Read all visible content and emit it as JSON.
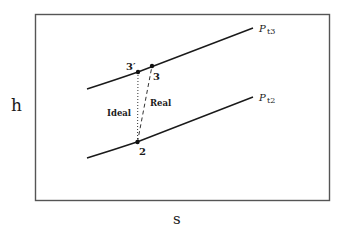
{
  "diagram": {
    "axes": {
      "y_label": "h",
      "x_label": "s"
    },
    "curves": [
      {
        "id": "pt3",
        "label_main": "P",
        "label_sub": "t3"
      },
      {
        "id": "pt2",
        "label_main": "P",
        "label_sub": "t2"
      }
    ],
    "points": {
      "p3prime": "3′",
      "p3": "3",
      "p2": "2"
    },
    "processes": {
      "ideal": "Ideal",
      "real": "Real"
    },
    "colors": {
      "line": "#1a1a1a",
      "frame": "#555555",
      "background": "#ffffff"
    }
  }
}
